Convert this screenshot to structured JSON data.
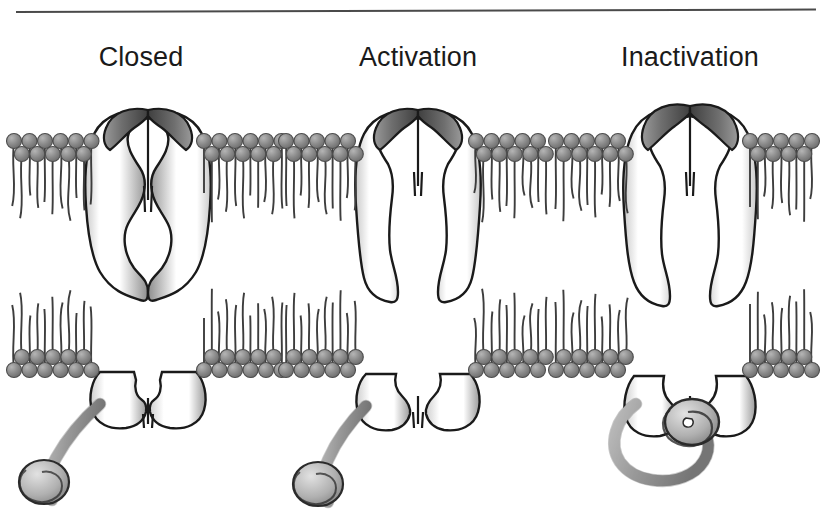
{
  "figure": {
    "background_color": "#ffffff",
    "rule_color": "#4a4a4a",
    "width": 821,
    "height": 532
  },
  "panels": [
    {
      "id": "closed",
      "label": "Closed",
      "center_x": 148,
      "state": "closed",
      "pore_open": false,
      "ball_position": "cytoplasm",
      "description": "Channel pore pinched shut at mid-membrane; inactivation ball tethered loose below"
    },
    {
      "id": "activation",
      "label": "Activation",
      "center_x": 418,
      "state": "open",
      "pore_open": true,
      "ball_position": "cytoplasm",
      "description": "Pore fully open through the membrane; inactivation ball still dangling"
    },
    {
      "id": "inactivation",
      "label": "Inactivation",
      "center_x": 690,
      "state": "inactivated",
      "pore_open": false,
      "ball_position": "pore-mouth",
      "description": "Pore blocked at the cytoplasmic mouth by the inactivation ball"
    }
  ],
  "membrane": {
    "name": "lipid bilayer",
    "top_y": 133,
    "bottom_y": 378,
    "leaflet_thickness": 48,
    "headgroup_color": "#8a8a8a",
    "headgroup_outline": "#4d4d4d",
    "tail_color": "#3d3d3d",
    "headgroup_radius": 7.5,
    "headgroup_rows_per_leaflet": 2
  },
  "protein": {
    "name": "channel protein subunits",
    "fill_light": "#ffffff",
    "fill_shadow": "#8f8f8f",
    "outline_color": "#1a1a1a",
    "subunits_visible": 2
  },
  "ball_and_chain": {
    "name": "inactivation ball and chain",
    "ball_fill": "#b3b3b3",
    "chain_fill": "#c9c9c9",
    "outline_color": "#2b2b2b"
  }
}
